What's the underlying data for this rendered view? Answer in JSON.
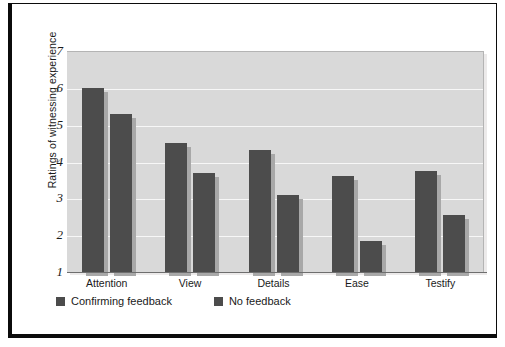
{
  "chart_data": {
    "type": "bar",
    "title": "",
    "xlabel": "",
    "ylabel": "Ratings of witnessing experience",
    "categories": [
      "Attention",
      "View",
      "Details",
      "Ease",
      "Testify"
    ],
    "series": [
      {
        "name": "Confirming feedback",
        "color": "#4c4c4c",
        "values": [
          6.0,
          4.5,
          4.3,
          3.6,
          3.75
        ]
      },
      {
        "name": "No feedback",
        "color": "#4c4c4c",
        "values": [
          5.3,
          3.7,
          3.1,
          1.85,
          2.55
        ]
      }
    ],
    "ylim": [
      1,
      7
    ],
    "yticks": [
      7,
      6,
      5,
      4,
      3,
      2,
      1
    ],
    "ytick_labels": [
      "7",
      "6",
      "5",
      "4",
      "3",
      "2",
      "1"
    ],
    "grid": true,
    "legend_position": "below-left",
    "plot_background": "#d9d9d9",
    "gridline_color": "#f7f7f7",
    "frame_color": "#0b0b0b"
  },
  "legend": {
    "items": [
      {
        "label": "Confirming feedback"
      },
      {
        "label": "No feedback"
      }
    ]
  }
}
